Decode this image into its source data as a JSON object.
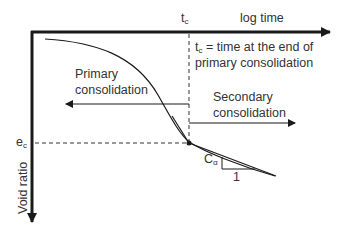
{
  "diagram": {
    "type": "void-ratio-vs-log-time",
    "x_axis": {
      "label": "log time",
      "tick_label": "t",
      "tick_subscript": "c"
    },
    "y_axis": {
      "label": "Void ratio",
      "tick_label": "e",
      "tick_subscript": "c"
    },
    "tc_definition": {
      "symbol": "t",
      "subscript": "c",
      "line1_rest": " = time at the end of",
      "line2": "primary consolidation"
    },
    "primary": {
      "line1": "Primary",
      "line2": "consolidation"
    },
    "secondary": {
      "line1": "Secondary",
      "line2": "consolidation"
    },
    "slope": {
      "symbol": "C",
      "subscript": "α",
      "run_label": "1"
    },
    "colors": {
      "line": "#1a1a1a",
      "text": "#333333",
      "background": "#ffffff"
    }
  }
}
